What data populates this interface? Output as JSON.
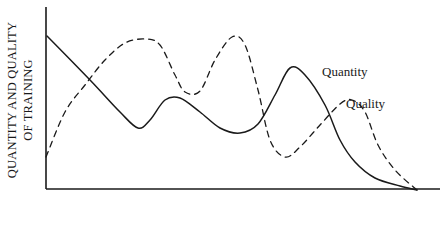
{
  "chart_data": {
    "type": "line",
    "title": "",
    "xlabel": "",
    "ylabel": "QUANTITY AND QUALITY OF TRAINING",
    "ylabel_lines": [
      "QUANTITY AND QUALITY",
      "OF TRAINING"
    ],
    "grid": false,
    "legend": "inline labels",
    "ticks": {
      "x": [],
      "y": []
    },
    "units": "pixel coordinates (x right, y down); axis origin at (46,189)",
    "axes": {
      "origin": [
        46,
        189
      ],
      "y_top": 7,
      "x_right": 440
    },
    "series": [
      {
        "name": "Quantity",
        "style": "solid",
        "color": "#1a1a1a",
        "label_pos": [
          322,
          78
        ],
        "points": [
          [
            47,
            36
          ],
          [
            90,
            80
          ],
          [
            120,
            112
          ],
          [
            138,
            128
          ],
          [
            150,
            120
          ],
          [
            165,
            100
          ],
          [
            180,
            98
          ],
          [
            200,
            112
          ],
          [
            220,
            128
          ],
          [
            240,
            133
          ],
          [
            258,
            124
          ],
          [
            275,
            95
          ],
          [
            290,
            68
          ],
          [
            305,
            75
          ],
          [
            325,
            105
          ],
          [
            340,
            140
          ],
          [
            355,
            162
          ],
          [
            375,
            178
          ],
          [
            400,
            186
          ],
          [
            417,
            190
          ]
        ]
      },
      {
        "name": "Quality",
        "style": "dashed",
        "color": "#1a1a1a",
        "label_pos": [
          346,
          108
        ],
        "points": [
          [
            46,
            157
          ],
          [
            65,
            112
          ],
          [
            85,
            85
          ],
          [
            105,
            60
          ],
          [
            125,
            43
          ],
          [
            145,
            39
          ],
          [
            160,
            45
          ],
          [
            175,
            75
          ],
          [
            185,
            92
          ],
          [
            200,
            91
          ],
          [
            215,
            60
          ],
          [
            232,
            37
          ],
          [
            245,
            45
          ],
          [
            258,
            90
          ],
          [
            270,
            140
          ],
          [
            285,
            157
          ],
          [
            300,
            147
          ],
          [
            320,
            125
          ],
          [
            340,
            104
          ],
          [
            352,
            100
          ],
          [
            365,
            112
          ],
          [
            378,
            145
          ],
          [
            395,
            170
          ],
          [
            417,
            190
          ]
        ]
      }
    ],
    "annotations": [
      "Quantity",
      "Quality"
    ]
  },
  "labels": {
    "ylabel_line1": "QUANTITY AND QUALITY",
    "ylabel_line2": "OF TRAINING",
    "quantity": "Quantity",
    "quality": "Quality"
  },
  "colors": {
    "ink": "#1a1a1a",
    "background": "#ffffff"
  }
}
